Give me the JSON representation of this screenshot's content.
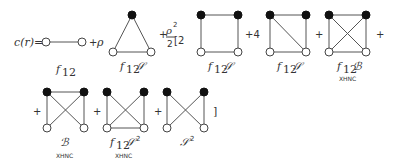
{
  "equation": {
    "lhs": "c(r)=",
    "terms": [
      {
        "prefix": "",
        "label": "f₁₂",
        "sublabel": ""
      },
      {
        "prefix": "+ ρ",
        "label": "f₁₂𝒮",
        "sublabel": ""
      },
      {
        "prefix": "+ ρ²/2 [2",
        "label": "f₁₂𝒮",
        "sublabel": ""
      },
      {
        "prefix": "+4",
        "label": "f₁₂𝒮",
        "sublabel": ""
      },
      {
        "prefix": "+",
        "label": "f₁₂ℬ",
        "sublabel": "XHNC"
      },
      {
        "prefix": "+",
        "label": "ℬ",
        "sublabel": "XHNC"
      },
      {
        "prefix": "+",
        "label": "f₁₂𝒮²",
        "sublabel": "XHNC"
      },
      {
        "prefix": "+",
        "label": "𝒮²",
        "sublabel": ""
      }
    ],
    "closing": "]"
  },
  "text": {
    "lhs": "c(r)=",
    "plus": "+",
    "rho": "ρ",
    "rho_sq_num": "ρ",
    "sq": "2",
    "half_den": "2",
    "bracket_two": "[2",
    "plus4": "+4",
    "close": "]",
    "f": "f",
    "sub12": "12",
    "S": "𝒮",
    "B": "ℬ",
    "xhnc": "XHNC"
  }
}
